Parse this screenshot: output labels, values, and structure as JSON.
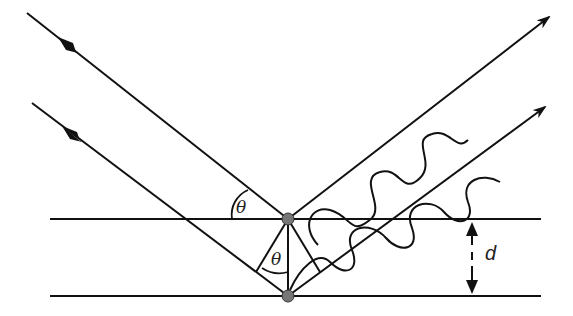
{
  "diagram": {
    "type": "bragg-diffraction",
    "labels": {
      "theta_top": "θ",
      "theta_inner": "θ",
      "spacing": "d"
    },
    "colors": {
      "line": "#111111",
      "atom": "#777777"
    },
    "elements": {
      "incident_rays": 2,
      "reflected_rays": 2,
      "lattice_planes": 2,
      "atoms": 2
    }
  }
}
